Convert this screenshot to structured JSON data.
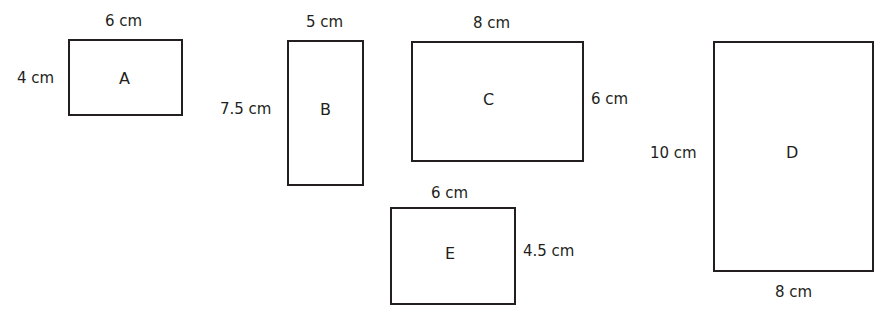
{
  "shapes": [
    {
      "id": "A",
      "name": "A",
      "width_label": "6 cm",
      "height_label": "4 cm"
    },
    {
      "id": "B",
      "name": "B",
      "width_label": "5 cm",
      "height_label": "7.5 cm"
    },
    {
      "id": "C",
      "name": "C",
      "width_label": "8 cm",
      "height_label": "6 cm"
    },
    {
      "id": "D",
      "name": "D",
      "width_label": "8 cm",
      "height_label": "10 cm"
    },
    {
      "id": "E",
      "name": "E",
      "width_label": "6 cm",
      "height_label": "4.5 cm"
    }
  ],
  "colors": {
    "stroke": "#231f20",
    "background": "#ffffff"
  }
}
